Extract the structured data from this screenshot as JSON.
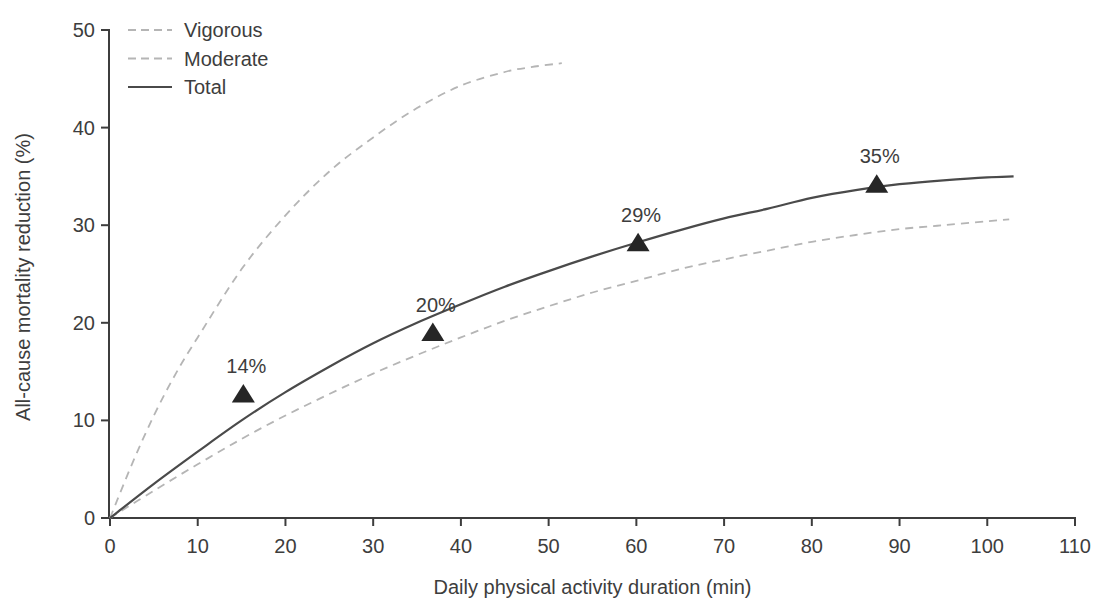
{
  "page": {
    "background": "#ffffff"
  },
  "chart_data": {
    "type": "line",
    "title": "",
    "xlabel": "Daily physical activity duration (min)",
    "ylabel": "All-cause mortality reduction (%)",
    "xlim": [
      0,
      110
    ],
    "ylim": [
      0,
      50
    ],
    "xticks": [
      0,
      10,
      20,
      30,
      40,
      50,
      60,
      70,
      80,
      90,
      100,
      110
    ],
    "yticks": [
      0,
      10,
      20,
      30,
      40,
      50
    ],
    "grid": false,
    "legend_position": "top-left-inside",
    "colors": {
      "axis": "#3d3d3d",
      "text": "#3d3d3d",
      "dashed_line": "#b5b5b5",
      "total_line": "#4a4a4a",
      "marker": "#262626",
      "background": "#ffffff"
    },
    "series": [
      {
        "name": "Vigorous",
        "style": "dashed",
        "x": [
          0,
          2.5,
          5,
          7.5,
          10,
          15,
          20,
          25,
          30,
          35,
          40,
          45,
          48,
          51.5
        ],
        "y": [
          0,
          5.5,
          10.5,
          14.8,
          18.5,
          25.5,
          31,
          35.5,
          39,
          42,
          44.3,
          45.7,
          46.2,
          46.6
        ]
      },
      {
        "name": "Moderate",
        "style": "dashed",
        "x": [
          0,
          5,
          10,
          15,
          20,
          25,
          30,
          35,
          40,
          45,
          50,
          55,
          60,
          65,
          70,
          75,
          80,
          85,
          90,
          95,
          100,
          102.5
        ],
        "y": [
          0,
          2.8,
          5.5,
          8.1,
          10.5,
          12.7,
          14.8,
          16.7,
          18.5,
          20.2,
          21.7,
          23.1,
          24.3,
          25.5,
          26.5,
          27.4,
          28.3,
          29.0,
          29.6,
          30.0,
          30.4,
          30.6
        ]
      },
      {
        "name": "Total",
        "style": "solid",
        "x": [
          0,
          5,
          10,
          15,
          20,
          25,
          30,
          35,
          40,
          45,
          50,
          55,
          60,
          65,
          70,
          75,
          80,
          85,
          90,
          95,
          100,
          103
        ],
        "y": [
          0,
          3.5,
          6.8,
          10,
          12.9,
          15.5,
          17.9,
          20,
          21.9,
          23.7,
          25.3,
          26.8,
          28.2,
          29.5,
          30.7,
          31.7,
          32.8,
          33.6,
          34.2,
          34.6,
          34.9,
          35
        ]
      }
    ],
    "markers": {
      "shape": "triangle-up",
      "series": "Total",
      "points": [
        {
          "x": 15.2,
          "y": 12.7,
          "label": "14%"
        },
        {
          "x": 36.8,
          "y": 19.0,
          "label": "20%"
        },
        {
          "x": 60.2,
          "y": 28.2,
          "label": "29%"
        },
        {
          "x": 87.4,
          "y": 34.2,
          "label": "35%"
        }
      ]
    }
  }
}
